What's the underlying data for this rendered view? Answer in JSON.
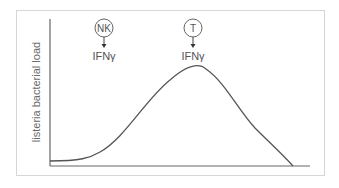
{
  "diagram": {
    "y_axis_label": "listeria bacterial load",
    "annotations": [
      {
        "cell": "NK",
        "cytokine": "IFNγ"
      },
      {
        "cell": "T",
        "cytokine": "IFNγ"
      }
    ],
    "curve": "bell-shaped rise and fall of bacterial load over time",
    "colors": {
      "line": "#555555",
      "frame": "#d6d6d6",
      "text": "#555555"
    }
  }
}
